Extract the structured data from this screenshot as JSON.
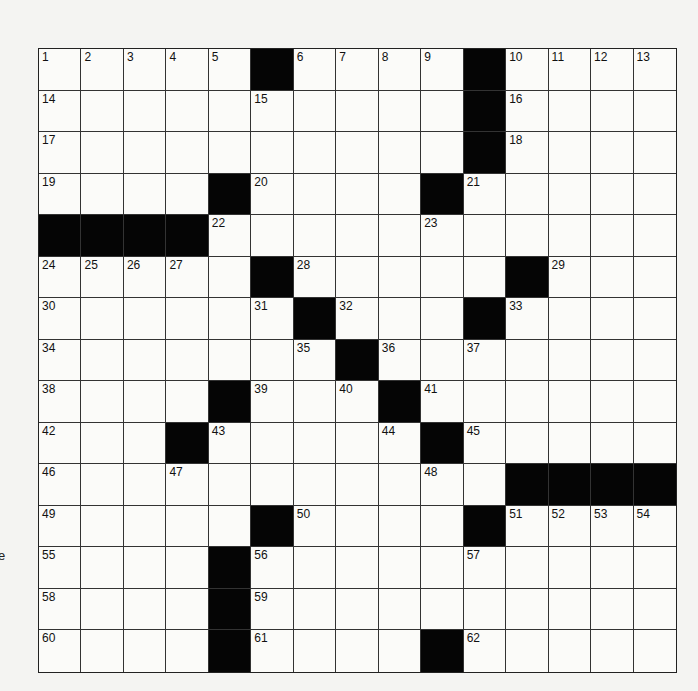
{
  "puzzle": {
    "rows": 15,
    "cols": 15,
    "black_cell_color": "#050505",
    "grid": [
      [
        "1",
        "2",
        "3",
        "4",
        "5",
        "#",
        "6",
        "7",
        "8",
        "9",
        "#",
        "10",
        "11",
        "12",
        "13"
      ],
      [
        "14",
        "",
        "",
        "",
        "",
        "15",
        "",
        "",
        "",
        "",
        "#",
        "16",
        "",
        "",
        ""
      ],
      [
        "17",
        "",
        "",
        "",
        "",
        "",
        "",
        "",
        "",
        "",
        "#",
        "18",
        "",
        "",
        ""
      ],
      [
        "19",
        "",
        "",
        "",
        "#",
        "20",
        "",
        "",
        "",
        "#",
        "21",
        "",
        "",
        "",
        ""
      ],
      [
        "#",
        "#",
        "#",
        "#",
        "22",
        "",
        "",
        "",
        "",
        "23",
        "",
        "",
        "",
        "",
        ""
      ],
      [
        "24",
        "25",
        "26",
        "27",
        "",
        "#",
        "28",
        "",
        "",
        "",
        "",
        "#",
        "29",
        "",
        ""
      ],
      [
        "30",
        "",
        "",
        "",
        "",
        "31",
        "#",
        "32",
        "",
        "",
        "#",
        "33",
        "",
        "",
        ""
      ],
      [
        "34",
        "",
        "",
        "",
        "",
        "",
        "35",
        "#",
        "36",
        "",
        "37",
        "",
        "",
        "",
        ""
      ],
      [
        "38",
        "",
        "",
        "",
        "#",
        "39",
        "",
        "40",
        "#",
        "41",
        "",
        "",
        "",
        "",
        ""
      ],
      [
        "42",
        "",
        "",
        "#",
        "43",
        "",
        "",
        "",
        "44",
        "#",
        "45",
        "",
        "",
        "",
        ""
      ],
      [
        "46",
        "",
        "",
        "47",
        "",
        "",
        "",
        "",
        "",
        "48",
        "",
        "#",
        "#",
        "#",
        "#"
      ],
      [
        "49",
        "",
        "",
        "",
        "",
        "#",
        "50",
        "",
        "",
        "",
        "#",
        "51",
        "52",
        "53",
        "54"
      ],
      [
        "55",
        "",
        "",
        "",
        "#",
        "56",
        "",
        "",
        "",
        "",
        "57",
        "",
        "",
        "",
        ""
      ],
      [
        "58",
        "",
        "",
        "",
        "#",
        "59",
        "",
        "",
        "",
        "",
        "",
        "",
        "",
        "",
        ""
      ],
      [
        "60",
        "",
        "",
        "",
        "#",
        "61",
        "",
        "",
        "",
        "#",
        "62",
        "",
        "",
        "",
        ""
      ]
    ],
    "entries": []
  },
  "margin_fragment": "e"
}
